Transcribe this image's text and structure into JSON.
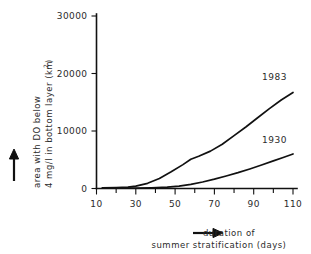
{
  "chart_data": {
    "type": "line",
    "title": "",
    "xlabel": "duration of summer stratification (days)",
    "ylabel": "area with DO below 4 mg/l in bottom layer (km2)",
    "xlim": [
      10,
      110
    ],
    "ylim": [
      0,
      30000
    ],
    "xticks": [
      10,
      20,
      30,
      40,
      50,
      60,
      70,
      80,
      90,
      100,
      110
    ],
    "xtick_labels": [
      "10",
      "",
      "30",
      "",
      "50",
      "",
      "70",
      "",
      "90",
      "",
      "110"
    ],
    "yticks": [
      0,
      10000,
      20000,
      30000
    ],
    "ytick_labels": [
      "0",
      "10000",
      "20000",
      "30000"
    ],
    "grid": false,
    "legend": "inline-labels",
    "series": [
      {
        "name": "1983",
        "label": "1983",
        "color": "#111111",
        "x": [
          13,
          20,
          26,
          30,
          36,
          42,
          48,
          54,
          58,
          62,
          68,
          74,
          80,
          86,
          92,
          98,
          104,
          110
        ],
        "values": [
          120,
          160,
          230,
          400,
          900,
          1750,
          2900,
          4150,
          5100,
          5600,
          6500,
          7700,
          9200,
          10700,
          12300,
          13900,
          15400,
          16700
        ]
      },
      {
        "name": "1930",
        "label": "1930",
        "color": "#111111",
        "x": [
          13,
          22,
          30,
          38,
          46,
          52,
          58,
          64,
          70,
          76,
          82,
          88,
          94,
          100,
          105,
          110
        ],
        "values": [
          60,
          70,
          90,
          130,
          230,
          420,
          720,
          1130,
          1620,
          2170,
          2760,
          3400,
          4080,
          4800,
          5400,
          6000
        ]
      }
    ]
  },
  "axis_titles": {
    "y_line1": "area with DO below",
    "y_line2": "4 mg/l in bottom layer (km",
    "y_superscript": "2",
    "y_closeparen": ")",
    "x_line1": "duration of",
    "x_line2": "summer stratification (days)"
  },
  "icons": {
    "y_arrow": "arrow-up-icon",
    "x_arrow": "arrow-right-icon"
  }
}
